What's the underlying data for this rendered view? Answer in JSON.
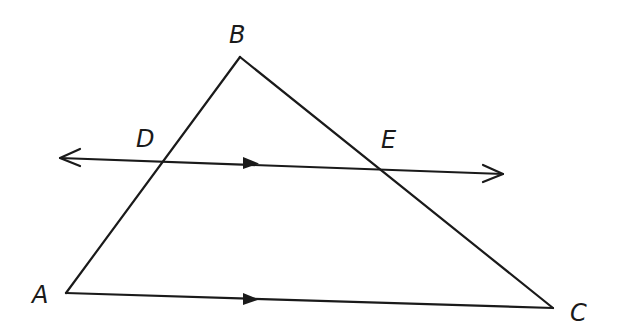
{
  "figure": {
    "type": "geometry-diagram",
    "stroke_color": "#1a1a1a",
    "background": "#ffffff"
  },
  "points": {
    "A": {
      "label": "A",
      "x": 66,
      "y": 293
    },
    "B": {
      "label": "B",
      "x": 240,
      "y": 57
    },
    "C": {
      "label": "C",
      "x": 553,
      "y": 308
    },
    "D": {
      "label": "D",
      "x": 163,
      "y": 162
    },
    "E": {
      "label": "E",
      "x": 375,
      "y": 169
    }
  },
  "segments": [
    {
      "name": "AB",
      "from": "A",
      "to": "B"
    },
    {
      "name": "BC",
      "from": "B",
      "to": "C"
    },
    {
      "name": "AC",
      "from": "A",
      "to": "C",
      "parallel_marker": true
    }
  ],
  "lines": [
    {
      "name": "DE",
      "through": [
        "D",
        "E"
      ],
      "arrow_both_ends": true,
      "parallel_marker": true
    }
  ],
  "relations": [
    "DE ∥ AC"
  ]
}
